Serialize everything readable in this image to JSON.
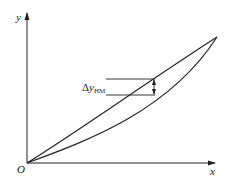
{
  "diagram": {
    "axes": {
      "x_label": "x",
      "y_label": "y",
      "origin_label": "O"
    },
    "curves": [
      {
        "name": "upper-curve",
        "description": "loading branch, nearly linear from origin to end point"
      },
      {
        "name": "lower-curve",
        "description": "unloading branch, convex, below upper curve"
      }
    ],
    "annotation": {
      "delta_symbol": "Δ",
      "variable": "y",
      "subscript": "HM",
      "meaning": "maximum hysteresis difference between the two curves"
    },
    "colors": {
      "line": "#222222",
      "background": "#ffffff"
    }
  }
}
